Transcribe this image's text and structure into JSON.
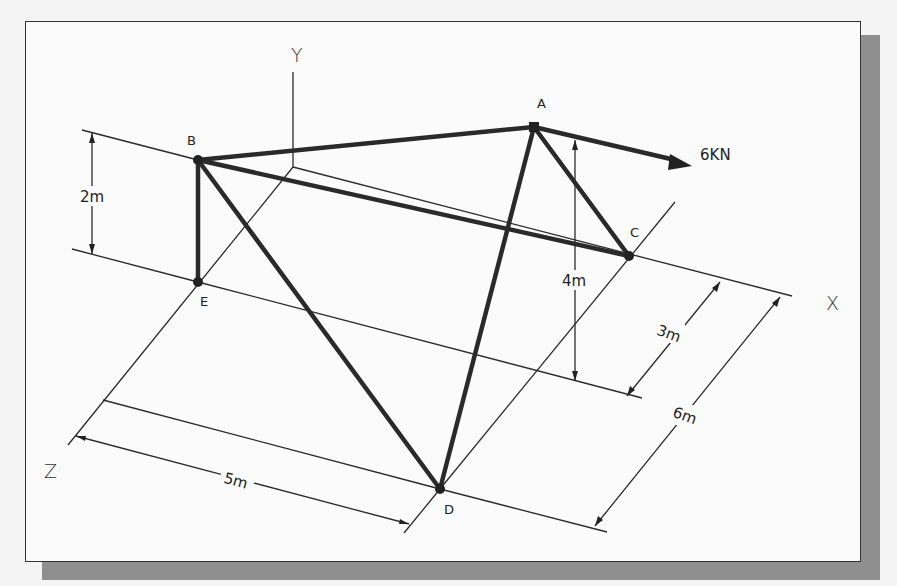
{
  "diagram": {
    "type": "3D space truss (isometric)",
    "axes": {
      "x_label": "X",
      "y_label": "Y",
      "z_label": "Z"
    },
    "nodes": [
      {
        "id": "A",
        "label": "A"
      },
      {
        "id": "B",
        "label": "B"
      },
      {
        "id": "C",
        "label": "C"
      },
      {
        "id": "D",
        "label": "D"
      },
      {
        "id": "E",
        "label": "E"
      }
    ],
    "members": [
      "A-B",
      "A-C",
      "A-D",
      "B-C",
      "B-D",
      "B-E"
    ],
    "load": {
      "node": "A",
      "label": "6KN",
      "direction": "+X"
    },
    "dimensions": {
      "be_height": "2m",
      "a_height": "4m",
      "c_offset_z": "3m",
      "d_offset_z": "6m",
      "d_offset_x": "5m"
    },
    "colors": {
      "ink": "#2a2a2a",
      "paper": "#fbfbfb",
      "shadow": "#8f8f8f"
    }
  }
}
